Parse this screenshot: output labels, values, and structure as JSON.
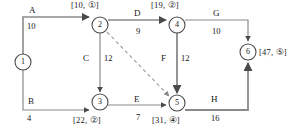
{
  "diagram": {
    "type": "activity-network-diagram",
    "nodes": [
      {
        "id": "1",
        "label": "1",
        "cx": 23,
        "cy": 62,
        "r": 8,
        "annotation": ""
      },
      {
        "id": "2",
        "label": "2",
        "cx": 100,
        "cy": 25,
        "r": 8,
        "annotation": "[10, ①]"
      },
      {
        "id": "3",
        "label": "3",
        "cx": 100,
        "cy": 102,
        "r": 8,
        "annotation": "[22, ②]"
      },
      {
        "id": "4",
        "label": "4",
        "cx": 177,
        "cy": 25,
        "r": 8,
        "annotation": "[19, ②]"
      },
      {
        "id": "5",
        "label": "5",
        "cx": 177,
        "cy": 103,
        "r": 8,
        "annotation": "[31, ④]"
      },
      {
        "id": "6",
        "label": "6",
        "cx": 248,
        "cy": 52,
        "r": 8,
        "annotation": "[47, ⑤]"
      }
    ],
    "edges": [
      {
        "id": "A",
        "name": "A",
        "weight": "10",
        "from": "1",
        "to": "2",
        "style": "solid"
      },
      {
        "id": "B",
        "name": "B",
        "weight": "4",
        "from": "1",
        "to": "3",
        "style": "solid"
      },
      {
        "id": "C",
        "name": "C",
        "weight": "12",
        "from": "2",
        "to": "3",
        "style": "solid"
      },
      {
        "id": "D",
        "name": "D",
        "weight": "9",
        "from": "2",
        "to": "4",
        "style": "solid"
      },
      {
        "id": "E",
        "name": "E",
        "weight": "7",
        "from": "3",
        "to": "5",
        "style": "solid"
      },
      {
        "id": "F",
        "name": "F",
        "weight": "12",
        "from": "4",
        "to": "5",
        "style": "solid"
      },
      {
        "id": "G",
        "name": "G",
        "weight": "10",
        "from": "4",
        "to": "6",
        "style": "solid"
      },
      {
        "id": "H",
        "name": "H",
        "weight": "16",
        "from": "5",
        "to": "6",
        "style": "solid"
      },
      {
        "id": "dummy",
        "name": "",
        "weight": "",
        "from": "2",
        "to": "5",
        "style": "dashed"
      }
    ],
    "node_annotations": {
      "n2": "[10, ①]",
      "n3": "[22, ②]",
      "n4": "[19, ②]",
      "n5": "[31, ④]",
      "n6": "[47, ⑤]"
    },
    "edge_labels": {
      "A": {
        "name": "A",
        "weight": "10"
      },
      "B": {
        "name": "B",
        "weight": "4"
      },
      "C": {
        "name": "C",
        "weight": "12"
      },
      "D": {
        "name": "D",
        "weight": "9"
      },
      "E": {
        "name": "E",
        "weight": "7"
      },
      "F": {
        "name": "F",
        "weight": "12"
      },
      "G": {
        "name": "G",
        "weight": "10"
      },
      "H": {
        "name": "H",
        "weight": "16"
      }
    },
    "node_labels": {
      "n1": "1",
      "n2": "2",
      "n3": "3",
      "n4": "4",
      "n5": "5",
      "n6": "6"
    },
    "colors": {
      "line": "#8a8a8a",
      "text": "#171717",
      "background": "#ffffff"
    }
  }
}
